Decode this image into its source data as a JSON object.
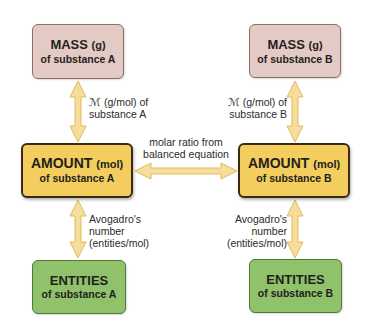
{
  "diagram": {
    "mass_a": {
      "title": "MASS",
      "unit": "(g)",
      "subtitle": "of substance A"
    },
    "mass_b": {
      "title": "MASS",
      "unit": "(g)",
      "subtitle": "of substance B"
    },
    "amount_a": {
      "title": "AMOUNT",
      "unit": "(mol)",
      "subtitle": "of substance A"
    },
    "amount_b": {
      "title": "AMOUNT",
      "unit": "(mol)",
      "subtitle": "of substance B"
    },
    "entities_a": {
      "title": "ENTITIES",
      "subtitle": "of substance A"
    },
    "entities_b": {
      "title": "ENTITIES",
      "subtitle": "of substance B"
    },
    "labels": {
      "molar_mass_a": [
        "ℳ (g/mol) of",
        "substance A"
      ],
      "molar_mass_b": [
        "ℳ (g/mol) of",
        "substance B"
      ],
      "molar_ratio": [
        "molar ratio from",
        "balanced equation"
      ],
      "avogadro_a": [
        "Avogadro's",
        "number",
        "(entities/mol)"
      ],
      "avogadro_b": [
        "Avogadro's",
        "number",
        "(entities/mol)"
      ]
    },
    "colors": {
      "mass_fill": "#e4cac4",
      "amount_fill": "#f3cd5e",
      "entities_fill": "#90c16b",
      "arrow_fill": "#f7dd9c",
      "arrow_stroke": "#e2b95c"
    }
  }
}
